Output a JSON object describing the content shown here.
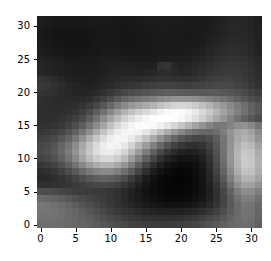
{
  "figure": {
    "type": "image-plot",
    "background_color": "#ffffff",
    "plot_area": {
      "left": 37,
      "top": 16,
      "width": 225,
      "height": 212
    }
  },
  "axes": {
    "x": {
      "label": "",
      "ticks": [
        0,
        5,
        10,
        15,
        20,
        25,
        30
      ],
      "tick_labels": [
        "0",
        "5",
        "10",
        "15",
        "20",
        "25",
        "30"
      ],
      "range": [
        -0.5,
        31.5
      ]
    },
    "y": {
      "label": "",
      "ticks": [
        0,
        5,
        10,
        15,
        20,
        25,
        30
      ],
      "tick_labels": [
        "0",
        "5",
        "10",
        "15",
        "20",
        "25",
        "30"
      ],
      "range": [
        31.5,
        -0.5
      ],
      "inverted": true
    },
    "tick_color": "#000000",
    "tick_label_color": "#000000"
  },
  "chart_data": {
    "type": "heatmap",
    "title": "",
    "xlabel": "",
    "ylabel": "",
    "colormap": "gray",
    "vmin": 0,
    "vmax": 255,
    "width": 32,
    "height": 32,
    "interpolation": "antialiased",
    "xtick_labels": [
      "0",
      "5",
      "10",
      "15",
      "20",
      "25",
      "30"
    ],
    "ytick_labels": [
      "0",
      "5",
      "10",
      "15",
      "20",
      "25",
      "30"
    ],
    "xticks": [
      0,
      5,
      10,
      15,
      20,
      25,
      30
    ],
    "yticks": [
      0,
      5,
      10,
      15,
      20,
      25,
      30
    ],
    "grid": false,
    "legend": false,
    "values": [
      [
        30,
        28,
        26,
        25,
        24,
        24,
        25,
        26,
        26,
        26,
        25,
        24,
        24,
        25,
        26,
        27,
        28,
        28,
        28,
        28,
        27,
        26,
        25,
        26,
        27,
        30,
        34,
        37,
        38,
        37,
        34,
        30
      ],
      [
        28,
        26,
        24,
        23,
        22,
        22,
        23,
        24,
        25,
        25,
        24,
        23,
        23,
        24,
        25,
        26,
        27,
        28,
        28,
        27,
        26,
        25,
        25,
        26,
        28,
        31,
        35,
        38,
        39,
        38,
        35,
        31
      ],
      [
        26,
        24,
        22,
        21,
        20,
        20,
        21,
        22,
        23,
        24,
        24,
        23,
        22,
        23,
        24,
        25,
        26,
        27,
        27,
        26,
        25,
        25,
        25,
        27,
        29,
        32,
        36,
        39,
        40,
        39,
        36,
        32
      ],
      [
        26,
        24,
        22,
        20,
        19,
        19,
        20,
        21,
        23,
        24,
        24,
        23,
        22,
        22,
        23,
        24,
        25,
        26,
        26,
        26,
        25,
        25,
        26,
        28,
        31,
        34,
        38,
        41,
        42,
        40,
        37,
        33
      ],
      [
        27,
        25,
        23,
        21,
        20,
        20,
        20,
        21,
        23,
        24,
        25,
        24,
        23,
        23,
        23,
        24,
        25,
        25,
        26,
        26,
        26,
        26,
        27,
        30,
        33,
        36,
        40,
        43,
        44,
        42,
        38,
        34
      ],
      [
        30,
        28,
        26,
        24,
        23,
        22,
        22,
        23,
        24,
        26,
        27,
        26,
        25,
        24,
        24,
        25,
        25,
        26,
        27,
        27,
        27,
        28,
        30,
        33,
        36,
        40,
        44,
        47,
        47,
        45,
        41,
        36
      ],
      [
        34,
        32,
        30,
        28,
        26,
        25,
        25,
        26,
        27,
        29,
        30,
        30,
        29,
        28,
        27,
        27,
        27,
        28,
        29,
        30,
        31,
        32,
        34,
        37,
        41,
        45,
        49,
        51,
        51,
        48,
        44,
        39
      ],
      [
        37,
        35,
        33,
        31,
        29,
        28,
        27,
        28,
        29,
        31,
        33,
        33,
        33,
        32,
        31,
        31,
        32,
        49,
        52,
        40,
        34,
        36,
        39,
        43,
        47,
        51,
        54,
        56,
        55,
        52,
        47,
        42
      ],
      [
        38,
        36,
        34,
        32,
        30,
        29,
        28,
        29,
        30,
        32,
        35,
        36,
        36,
        36,
        36,
        37,
        39,
        44,
        46,
        41,
        38,
        40,
        44,
        48,
        52,
        56,
        58,
        59,
        58,
        54,
        49,
        44
      ],
      [
        52,
        48,
        43,
        38,
        34,
        31,
        30,
        30,
        32,
        35,
        38,
        41,
        43,
        44,
        45,
        47,
        49,
        51,
        52,
        50,
        48,
        49,
        52,
        56,
        60,
        63,
        64,
        64,
        62,
        58,
        52,
        46
      ],
      [
        58,
        54,
        49,
        44,
        39,
        35,
        33,
        33,
        35,
        39,
        43,
        47,
        51,
        54,
        57,
        60,
        63,
        65,
        66,
        65,
        63,
        62,
        64,
        67,
        70,
        72,
        72,
        70,
        67,
        62,
        56,
        49
      ],
      [
        52,
        49,
        46,
        42,
        39,
        37,
        36,
        38,
        42,
        48,
        56,
        64,
        71,
        76,
        80,
        84,
        88,
        92,
        94,
        94,
        92,
        89,
        88,
        89,
        90,
        90,
        88,
        85,
        80,
        74,
        67,
        60
      ],
      [
        48,
        46,
        44,
        42,
        41,
        41,
        43,
        47,
        54,
        64,
        76,
        88,
        99,
        108,
        115,
        121,
        128,
        136,
        142,
        146,
        147,
        145,
        141,
        136,
        130,
        123,
        115,
        106,
        97,
        88,
        79,
        71
      ],
      [
        46,
        45,
        44,
        44,
        45,
        47,
        51,
        58,
        70,
        86,
        104,
        122,
        138,
        151,
        161,
        170,
        180,
        192,
        203,
        211,
        214,
        211,
        203,
        192,
        179,
        165,
        151,
        137,
        123,
        110,
        97,
        86
      ],
      [
        45,
        45,
        45,
        46,
        49,
        54,
        62,
        74,
        92,
        113,
        136,
        158,
        178,
        194,
        206,
        217,
        229,
        241,
        249,
        252,
        250,
        244,
        233,
        218,
        201,
        183,
        165,
        147,
        130,
        114,
        99,
        86
      ],
      [
        46,
        46,
        47,
        50,
        55,
        63,
        75,
        92,
        114,
        139,
        164,
        188,
        208,
        224,
        236,
        246,
        253,
        255,
        255,
        253,
        247,
        237,
        223,
        206,
        187,
        168,
        149,
        131,
        114,
        99,
        86,
        75
      ],
      [
        49,
        50,
        52,
        57,
        65,
        77,
        93,
        114,
        139,
        165,
        191,
        214,
        232,
        245,
        251,
        252,
        249,
        241,
        229,
        214,
        197,
        180,
        162,
        146,
        131,
        119,
        120,
        130,
        143,
        146,
        136,
        116
      ],
      [
        55,
        57,
        61,
        69,
        81,
        97,
        118,
        143,
        169,
        195,
        218,
        235,
        245,
        247,
        242,
        230,
        213,
        193,
        172,
        152,
        134,
        119,
        108,
        102,
        102,
        110,
        127,
        148,
        166,
        172,
        161,
        138
      ],
      [
        63,
        67,
        74,
        85,
        100,
        120,
        145,
        172,
        198,
        221,
        237,
        245,
        244,
        234,
        217,
        195,
        170,
        145,
        122,
        102,
        87,
        76,
        70,
        70,
        77,
        93,
        117,
        144,
        168,
        179,
        170,
        147
      ],
      [
        71,
        76,
        85,
        99,
        117,
        140,
        167,
        194,
        218,
        236,
        245,
        243,
        231,
        210,
        184,
        156,
        128,
        103,
        82,
        66,
        55,
        49,
        47,
        52,
        65,
        86,
        115,
        147,
        176,
        192,
        185,
        161
      ],
      [
        73,
        79,
        89,
        104,
        124,
        148,
        175,
        200,
        221,
        234,
        237,
        229,
        211,
        185,
        155,
        125,
        97,
        73,
        55,
        42,
        34,
        31,
        33,
        41,
        57,
        81,
        113,
        149,
        181,
        199,
        194,
        170
      ],
      [
        66,
        72,
        82,
        96,
        115,
        138,
        163,
        187,
        205,
        216,
        216,
        205,
        185,
        157,
        127,
        97,
        70,
        49,
        34,
        25,
        20,
        19,
        22,
        32,
        50,
        77,
        111,
        149,
        183,
        203,
        199,
        176
      ],
      [
        55,
        60,
        68,
        80,
        96,
        115,
        136,
        156,
        171,
        180,
        179,
        168,
        149,
        123,
        95,
        69,
        47,
        31,
        20,
        14,
        11,
        11,
        15,
        26,
        45,
        72,
        107,
        146,
        181,
        202,
        199,
        178
      ],
      [
        45,
        48,
        54,
        63,
        75,
        89,
        105,
        120,
        131,
        137,
        136,
        127,
        111,
        90,
        67,
        47,
        30,
        19,
        12,
        8,
        7,
        8,
        12,
        22,
        40,
        66,
        100,
        138,
        173,
        194,
        192,
        172
      ],
      [
        40,
        42,
        45,
        50,
        58,
        67,
        77,
        87,
        94,
        97,
        95,
        88,
        76,
        60,
        44,
        29,
        18,
        11,
        7,
        5,
        5,
        7,
        11,
        20,
        36,
        59,
        90,
        126,
        159,
        180,
        179,
        161
      ],
      [
        48,
        48,
        49,
        51,
        54,
        58,
        63,
        68,
        71,
        72,
        70,
        64,
        55,
        44,
        32,
        22,
        14,
        9,
        6,
        5,
        5,
        7,
        11,
        19,
        33,
        53,
        80,
        112,
        142,
        162,
        161,
        145
      ],
      [
        78,
        76,
        73,
        69,
        65,
        62,
        60,
        59,
        58,
        56,
        53,
        48,
        41,
        33,
        26,
        19,
        13,
        9,
        7,
        6,
        6,
        8,
        12,
        19,
        31,
        48,
        71,
        98,
        124,
        141,
        140,
        126
      ],
      [
        106,
        103,
        99,
        93,
        87,
        80,
        74,
        69,
        64,
        59,
        54,
        48,
        41,
        34,
        27,
        21,
        16,
        12,
        10,
        9,
        10,
        12,
        16,
        23,
        33,
        48,
        68,
        91,
        113,
        127,
        126,
        113
      ],
      [
        118,
        116,
        112,
        107,
        100,
        93,
        85,
        78,
        71,
        64,
        57,
        50,
        44,
        38,
        32,
        27,
        23,
        20,
        18,
        17,
        18,
        21,
        25,
        31,
        40,
        53,
        69,
        88,
        106,
        117,
        116,
        104
      ],
      [
        118,
        117,
        115,
        111,
        106,
        100,
        93,
        86,
        78,
        71,
        64,
        58,
        52,
        47,
        42,
        38,
        35,
        33,
        32,
        32,
        33,
        36,
        40,
        46,
        54,
        64,
        77,
        92,
        106,
        115,
        114,
        102
      ],
      [
        113,
        113,
        112,
        110,
        107,
        103,
        98,
        92,
        86,
        79,
        73,
        67,
        62,
        57,
        53,
        50,
        48,
        47,
        47,
        48,
        50,
        53,
        57,
        63,
        70,
        78,
        88,
        99,
        108,
        114,
        112,
        100
      ],
      [
        108,
        109,
        109,
        108,
        106,
        103,
        100,
        96,
        91,
        86,
        81,
        76,
        71,
        67,
        64,
        61,
        60,
        59,
        60,
        61,
        63,
        66,
        70,
        76,
        82,
        89,
        96,
        103,
        108,
        111,
        108,
        96
      ]
    ]
  }
}
